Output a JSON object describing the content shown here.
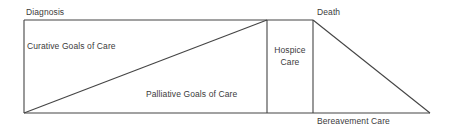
{
  "diagram": {
    "type": "continuum-of-care",
    "background_color": "#ffffff",
    "line_color": "#444444",
    "text_color": "#3b3b3b",
    "labels": {
      "diagnosis": "Diagnosis",
      "death": "Death",
      "curative": "Curative Goals of Care",
      "palliative": "Palliative Goals of Care",
      "hospice_line1": "Hospice",
      "hospice_line2": "Care",
      "bereavement": "Bereavement Care"
    },
    "geometry": {
      "left_x": 24,
      "top_y": 20,
      "bottom_y": 113,
      "hospice_left_x": 267,
      "death_x": 313,
      "right_tip_x": 430
    }
  }
}
